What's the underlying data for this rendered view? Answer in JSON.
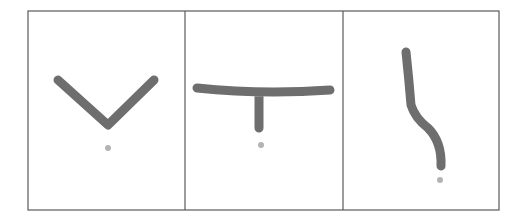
{
  "figure": {
    "colors": {
      "background": "#ffffff",
      "frame": "#5a5a5a",
      "stroke": "#6e6e6e",
      "dot": "#b3b3b3"
    },
    "frame": {
      "x": 28,
      "y": 11,
      "width": 471,
      "height": 199
    },
    "dividers": [
      185,
      343
    ],
    "panels": [
      {
        "id": "panel-1",
        "shape": "v-shape",
        "path": "M58,80 L108,125 L154,80",
        "dot": {
          "cx": 108,
          "cy": 148,
          "r": 3
        }
      },
      {
        "id": "panel-2",
        "shape": "t-shape",
        "path": "M197,88 Q262,95 330,90 M259,93 L259,128",
        "dot": {
          "cx": 261,
          "cy": 145,
          "r": 3
        }
      },
      {
        "id": "panel-3",
        "shape": "s-curve",
        "path": "M406,52 Q409,80 411,105 Q415,118 428,128 Q442,142 441,166",
        "dot": {
          "cx": 440,
          "cy": 180,
          "r": 3
        }
      }
    ]
  }
}
